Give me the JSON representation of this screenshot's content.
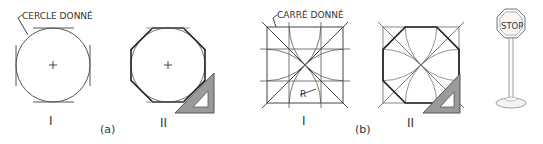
{
  "figure": {
    "part_a": {
      "label": "(a)",
      "step1": {
        "numeral": "I",
        "annotation": "CERCLE DONNÉ"
      },
      "step2": {
        "numeral": "II"
      }
    },
    "part_b": {
      "label": "(b)",
      "step1": {
        "numeral": "I",
        "annotation": "CARRÉ DONNÉ",
        "radius_label": "R"
      },
      "step2": {
        "numeral": "II"
      }
    },
    "stop_sign": {
      "text": "STOP"
    }
  },
  "colors": {
    "line": "#333333",
    "thin_line": "#666666",
    "set_square_fill": "#9a9a9a",
    "set_square_stroke": "#555555",
    "background": "#ffffff"
  }
}
